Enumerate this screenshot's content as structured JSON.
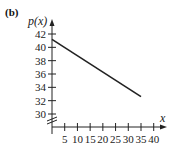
{
  "panel_label": "(b)",
  "chart_data": {
    "type": "line",
    "title": "",
    "xlabel": "x",
    "ylabel": "p(x)",
    "x_ticks": [
      5,
      10,
      15,
      20,
      25,
      30,
      35,
      40
    ],
    "y_ticks": [
      30,
      32,
      34,
      36,
      38,
      40,
      42
    ],
    "xlim": [
      0,
      40
    ],
    "ylim": [
      29,
      43
    ],
    "y_axis_break": true,
    "grid": false,
    "legend": null,
    "series": [
      {
        "name": "p(x)",
        "x": [
          0,
          35
        ],
        "y": [
          41.2,
          32.6
        ],
        "color": "#222222"
      }
    ]
  },
  "tick_labels": {
    "x": [
      "5",
      "10",
      "15",
      "20",
      "25",
      "30",
      "35",
      "40"
    ],
    "y": [
      "30",
      "32",
      "34",
      "36",
      "38",
      "40",
      "42"
    ]
  },
  "axis_labels": {
    "x": "x",
    "y": "p(x)"
  }
}
